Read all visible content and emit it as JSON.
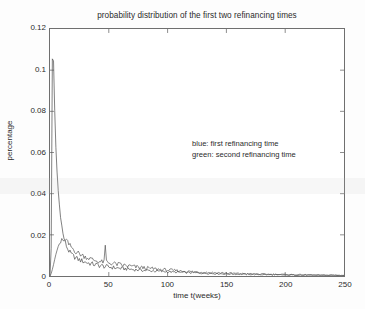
{
  "chart_data": {
    "type": "line",
    "title": "probability distribution of the first two refinancing times",
    "xlabel": "time t(weeks)",
    "ylabel": "percentage",
    "xlim": [
      0,
      250
    ],
    "ylim": [
      0,
      0.12
    ],
    "xticks": [
      0,
      50,
      100,
      150,
      200,
      250
    ],
    "xtick_labels": [
      "0",
      "50",
      "100",
      "150",
      "200",
      "250"
    ],
    "yticks": [
      0,
      0.02,
      0.04,
      0.06,
      0.08,
      0.1,
      0.12
    ],
    "ytick_labels": [
      "0",
      "0.02",
      "0.04",
      "0.06",
      "0.08",
      "0.1",
      "0.12"
    ],
    "grid": false,
    "legend_position": "center-right-inside",
    "legend_entries": [
      "blue: first refinancing time",
      "green: second refinancing time"
    ],
    "series": [
      {
        "name": "first refinancing time",
        "color": "#4a4a4a",
        "x": [
          0,
          1,
          2,
          3,
          4,
          5,
          6,
          7,
          8,
          9,
          10,
          11,
          12,
          13,
          14,
          15,
          16,
          17,
          18,
          19,
          20,
          22,
          24,
          26,
          28,
          30,
          32,
          34,
          36,
          38,
          40,
          42,
          44,
          46,
          48,
          50,
          54,
          58,
          62,
          66,
          70,
          74,
          78,
          82,
          86,
          90,
          95,
          100,
          105,
          110,
          115,
          120,
          125,
          130,
          135,
          140,
          145,
          150,
          160,
          170,
          180,
          190,
          200,
          210,
          220,
          230,
          240,
          250
        ],
        "y": [
          0.0,
          0.0135,
          0.1055,
          0.1045,
          0.0805,
          0.0625,
          0.0505,
          0.0415,
          0.0345,
          0.0295,
          0.0245,
          0.0205,
          0.0182,
          0.0163,
          0.0146,
          0.0132,
          0.0122,
          0.0114,
          0.0107,
          0.0101,
          0.0096,
          0.0088,
          0.0081,
          0.0076,
          0.0072,
          0.0068,
          0.0064,
          0.0061,
          0.0058,
          0.0056,
          0.0053,
          0.0051,
          0.0049,
          0.0047,
          0.0045,
          0.0044,
          0.0041,
          0.0038,
          0.0036,
          0.0034,
          0.0032,
          0.003,
          0.0028,
          0.0027,
          0.0025,
          0.0024,
          0.0022,
          0.0021,
          0.0019,
          0.0018,
          0.0017,
          0.0016,
          0.0015,
          0.0014,
          0.0013,
          0.0012,
          0.0011,
          0.001,
          0.0009,
          0.0008,
          0.0007,
          0.0006,
          0.0005,
          0.0005,
          0.0004,
          0.0004,
          0.0003,
          0.0003
        ]
      },
      {
        "name": "second refinancing time",
        "color": "#555555",
        "x": [
          0,
          1,
          2,
          3,
          4,
          5,
          6,
          7,
          8,
          9,
          10,
          11,
          12,
          13,
          14,
          15,
          16,
          17,
          18,
          19,
          20,
          22,
          24,
          26,
          28,
          30,
          32,
          34,
          36,
          38,
          40,
          42,
          44,
          45,
          46,
          47,
          48,
          49,
          50,
          52,
          54,
          58,
          62,
          66,
          70,
          74,
          78,
          82,
          86,
          90,
          95,
          100,
          105,
          110,
          115,
          120,
          125,
          130,
          135,
          140,
          145,
          150,
          160,
          170,
          180,
          190,
          200,
          210,
          220,
          230,
          240,
          250
        ],
        "y": [
          0.0,
          0.0012,
          0.0032,
          0.0055,
          0.0081,
          0.0105,
          0.0125,
          0.0142,
          0.0155,
          0.0163,
          0.0172,
          0.0165,
          0.0178,
          0.0168,
          0.0175,
          0.0162,
          0.0152,
          0.0148,
          0.0141,
          0.0136,
          0.0128,
          0.0118,
          0.0112,
          0.0105,
          0.0099,
          0.0094,
          0.0089,
          0.0084,
          0.008,
          0.0076,
          0.0073,
          0.007,
          0.0068,
          0.0069,
          0.0067,
          0.0146,
          0.0071,
          0.0066,
          0.0064,
          0.0062,
          0.006,
          0.0056,
          0.0052,
          0.0049,
          0.0046,
          0.0043,
          0.0041,
          0.0038,
          0.0036,
          0.0034,
          0.0031,
          0.0029,
          0.0027,
          0.0025,
          0.0023,
          0.0021,
          0.002,
          0.0018,
          0.0017,
          0.0016,
          0.0015,
          0.0014,
          0.0012,
          0.001,
          0.0009,
          0.0008,
          0.0007,
          0.0006,
          0.0005,
          0.0004,
          0.0004,
          0.0003
        ]
      }
    ]
  }
}
